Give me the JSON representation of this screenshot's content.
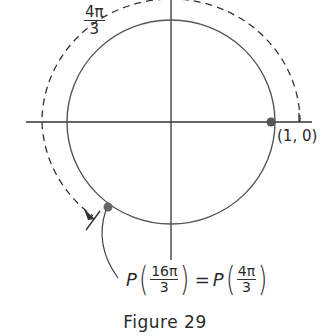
{
  "figure": {
    "caption": "Figure 29",
    "arc_label": {
      "numerator": "4π",
      "denominator": "3"
    },
    "point_start_label": "(1, 0)",
    "equation": {
      "lhs_func": "P",
      "lhs_numerator": "16π",
      "lhs_denominator": "3",
      "equals": "=",
      "rhs_func": "P",
      "rhs_numerator": "4π",
      "rhs_denominator": "3"
    }
  },
  "diagram": {
    "type": "unit-circle",
    "center": [
      171,
      122
    ],
    "radius": 103,
    "dashed_arc_radius": 129,
    "start_point": {
      "angle_deg": 0,
      "label": "(1, 0)"
    },
    "end_point": {
      "angle_rad": "4π/3",
      "equivalent": "16π/3"
    },
    "colors": {
      "stroke": "#3a3a3a",
      "point": "#555555"
    }
  }
}
